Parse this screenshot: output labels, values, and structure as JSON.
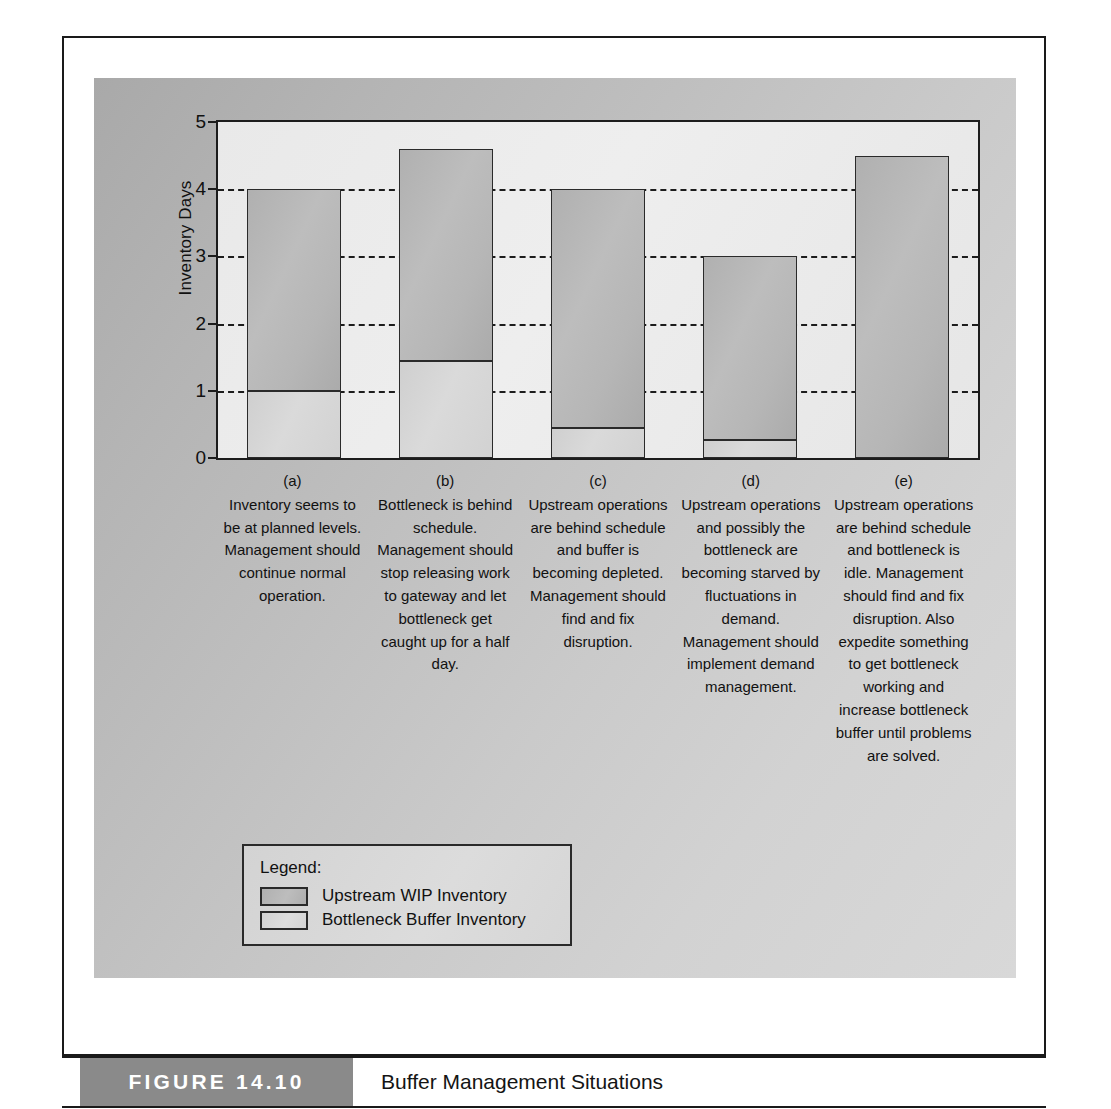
{
  "figure": {
    "number_label": "FIGURE 14.10",
    "title": "Buffer Management Situations"
  },
  "chart_data": {
    "type": "bar",
    "stacked": true,
    "title": "Buffer Management Situations",
    "xlabel": "",
    "ylabel": "Inventory Days",
    "ylim": [
      0,
      5
    ],
    "yticks": [
      0,
      1,
      2,
      3,
      4,
      5
    ],
    "grid": "horizontal dashed gridlines at 1, 2, 3, 4",
    "legend_position": "inside lower-left below plot",
    "categories": [
      "(a)",
      "(b)",
      "(c)",
      "(d)",
      "(e)"
    ],
    "series": [
      {
        "name": "Bottleneck Buffer Inventory",
        "color": "#d6d6d6",
        "values": [
          1.0,
          1.45,
          0.45,
          0.27,
          0.0
        ]
      },
      {
        "name": "Upstream WIP Inventory",
        "color": "#b5b5b5",
        "values": [
          3.0,
          3.15,
          3.55,
          2.73,
          4.5
        ]
      }
    ],
    "totals": [
      4.0,
      4.6,
      4.0,
      3.0,
      4.5
    ]
  },
  "yaxis": {
    "title": "Inventory Days",
    "ticks": [
      "5",
      "4",
      "3",
      "2",
      "1",
      "0"
    ]
  },
  "columns": [
    {
      "letter": "(a)",
      "text": "Inventory seems to be at planned levels. Management should continue normal operation."
    },
    {
      "letter": "(b)",
      "text": "Bottleneck is behind schedule. Management should stop releasing work to gateway and let bottleneck get caught up for a half day."
    },
    {
      "letter": "(c)",
      "text": "Upstream operations are behind schedule and buffer is becoming depleted. Management should find and fix disruption."
    },
    {
      "letter": "(d)",
      "text": "Upstream operations and possibly the bottleneck are becoming starved by fluctuations in demand. Management should implement demand management."
    },
    {
      "letter": "(e)",
      "text": "Upstream operations are behind schedule and bottleneck is idle. Management should find and fix disruption. Also expedite something to get bottleneck working and increase bottleneck buffer until problems are solved."
    }
  ],
  "legend": {
    "title": "Legend:",
    "items": [
      {
        "label": "Upstream WIP Inventory"
      },
      {
        "label": "Bottleneck Buffer Inventory"
      }
    ]
  }
}
